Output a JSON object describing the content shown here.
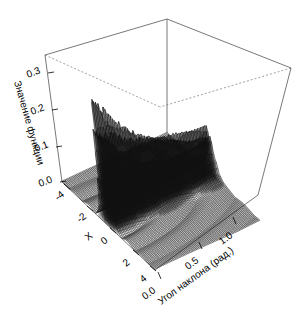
{
  "chart_data": {
    "type": "surface",
    "title": "",
    "xlabel": "X",
    "ylabel": "Угол наклона (рад.)",
    "zlabel": "Значение функции",
    "xlim": [
      -5,
      5
    ],
    "ylim": [
      0.0,
      1.2
    ],
    "zlim": [
      0.0,
      0.35
    ],
    "x_ticks": [
      "-4",
      "-2",
      "0",
      "2",
      "4"
    ],
    "x_tick_values": [
      -4,
      -2,
      0,
      2,
      4
    ],
    "y_ticks": [
      "0.0",
      "0.5",
      "1.0"
    ],
    "y_tick_values": [
      0.0,
      0.5,
      1.0
    ],
    "z_ticks": [
      "0.0",
      "0.1",
      "0.2",
      "0.3"
    ],
    "z_tick_values": [
      0.0,
      0.1,
      0.2,
      0.3
    ],
    "grid": false,
    "legend": "none",
    "projection": "perspective-wireframe",
    "surface_description": "Oscillatory diffraction-like surface: a tall narrow noisy ridge of spikes rising to about 0.35 near X=0 running along the tilt-angle axis, falling off rapidly to a near-zero dark mesh plateau on both sides, with concentric ripple arcs in the low front-right region.",
    "series": [
      {
        "name": "f(X, угол наклона)",
        "peak_value": 0.35,
        "peak_at": {
          "x": 0,
          "y": 0.0
        },
        "baseline_value": 0.0
      }
    ]
  },
  "axes": {
    "z": {
      "label": "Значение функции",
      "ticks": [
        {
          "label": "0.3",
          "value": 0.3
        },
        {
          "label": "0.2",
          "value": 0.2
        },
        {
          "label": "0.1",
          "value": 0.1
        },
        {
          "label": "0.0",
          "value": 0.0
        }
      ]
    },
    "x": {
      "label": "X",
      "ticks": [
        {
          "label": "-4",
          "value": -4
        },
        {
          "label": "-2",
          "value": -2
        },
        {
          "label": "0",
          "value": 0
        },
        {
          "label": "2",
          "value": 2
        },
        {
          "label": "4",
          "value": 4
        }
      ]
    },
    "y": {
      "label": "Угол наклона (рад.)",
      "ticks": [
        {
          "label": "0.0",
          "value": 0.0
        },
        {
          "label": "0.5",
          "value": 0.5
        },
        {
          "label": "1.0",
          "value": 1.0
        }
      ]
    }
  },
  "style": {
    "background": "#ffffff",
    "mesh_color": "#111111",
    "box_color": "#555555",
    "hidden_edge_color": "#777777",
    "text_color": "#000000"
  }
}
